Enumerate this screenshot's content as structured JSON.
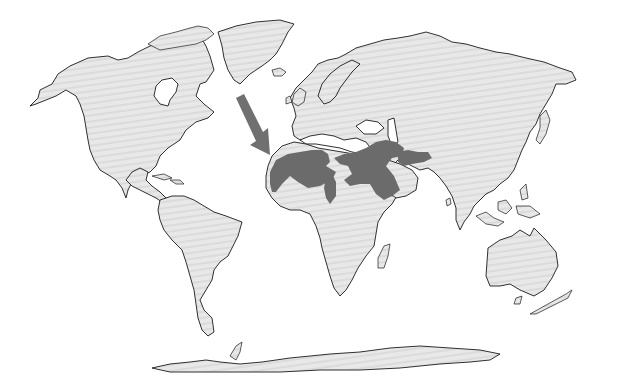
{
  "map": {
    "title": "World map highlighting region in North Africa and the Middle East",
    "projection": "world outline map",
    "colors": {
      "background": "#ffffff",
      "land": "#e6e6e6",
      "land_hatch": "#d8d8d8",
      "coastline": "#1a1a1a",
      "highlighted_region": "#6b6b6b",
      "arrow": "#707070"
    },
    "highlighted_region": {
      "label": "North Africa, Arabian Peninsula and Middle East (shaded)",
      "areas": [
        "Sahara / North Africa",
        "Egypt and Nile region",
        "Horn of Africa",
        "Arabian Peninsula",
        "Levant",
        "Mesopotamia",
        "Iran"
      ]
    },
    "arrow": {
      "icon": "arrow-down-right-icon",
      "points_to": "Northwest Africa / Canary Islands coast"
    },
    "continents": [
      "North America",
      "Greenland",
      "South America",
      "Europe",
      "Africa",
      "Asia",
      "Australia",
      "Antarctica"
    ]
  }
}
